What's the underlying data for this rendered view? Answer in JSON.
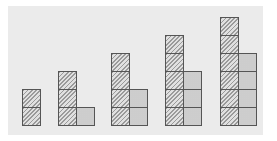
{
  "figure": {
    "cell_size_px": 18,
    "baseline_y": 125,
    "colors": {
      "panel": "#ebebeb",
      "border": "#555555",
      "hatch": "#9a9a9a",
      "dots": "#a8a8a8"
    },
    "figures": [
      {
        "index": 1,
        "x": 22,
        "hatched": 2,
        "dotted": 0
      },
      {
        "index": 2,
        "x": 58,
        "hatched": 3,
        "dotted": 1
      },
      {
        "index": 3,
        "x": 111,
        "hatched": 4,
        "dotted": 2
      },
      {
        "index": 4,
        "x": 165,
        "hatched": 5,
        "dotted": 3
      },
      {
        "index": 5,
        "x": 220,
        "hatched": 6,
        "dotted": 4
      }
    ]
  }
}
